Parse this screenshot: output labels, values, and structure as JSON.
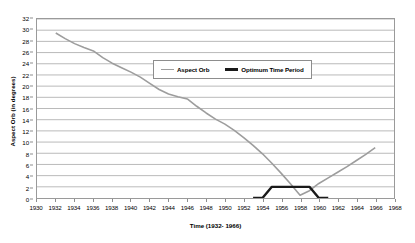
{
  "chart_data": {
    "type": "line",
    "title": "",
    "xlabel": "Time (1932- 1966)",
    "ylabel": "Aspect Orb (in degrees)",
    "xlim": [
      1930,
      1968
    ],
    "ylim": [
      0,
      32
    ],
    "xticks": [
      1930,
      1932,
      1934,
      1936,
      1938,
      1940,
      1942,
      1944,
      1946,
      1948,
      1950,
      1952,
      1954,
      1956,
      1958,
      1960,
      1962,
      1964,
      1966,
      1968
    ],
    "yticks": [
      0,
      2,
      4,
      6,
      8,
      10,
      12,
      14,
      16,
      18,
      20,
      22,
      24,
      26,
      28,
      30,
      32
    ],
    "grid": "horizontal",
    "legend_position": "upper-center",
    "series": [
      {
        "name": "Aspect Orb",
        "color": "#9d9d9d",
        "width": 1.6,
        "x": [
          1932,
          1933,
          1934,
          1935,
          1936,
          1937,
          1938,
          1939,
          1940,
          1941,
          1942,
          1943,
          1944,
          1945,
          1946,
          1947,
          1948,
          1949,
          1950,
          1951,
          1952,
          1953,
          1954,
          1955,
          1956,
          1957,
          1958,
          1959,
          1960,
          1961,
          1962,
          1963,
          1964,
          1965,
          1966
        ],
        "values": [
          29.5,
          28.5,
          27.6,
          26.9,
          26.3,
          25.1,
          24.1,
          23.3,
          22.5,
          21.6,
          20.5,
          19.4,
          18.6,
          18.1,
          17.7,
          16.4,
          15.2,
          14.1,
          13.2,
          12.1,
          10.8,
          9.4,
          7.9,
          6.2,
          4.4,
          2.5,
          0.5,
          1.3,
          2.6,
          3.6,
          4.6,
          5.6,
          6.7,
          7.8,
          9.0
        ]
      },
      {
        "name": "Optimum Time Period",
        "color": "#1a1a1a",
        "width": 2.4,
        "x": [
          1953,
          1954,
          1955,
          1956,
          1957,
          1958,
          1959,
          1960,
          1961
        ],
        "values": [
          0,
          0,
          2,
          2,
          2,
          2,
          2,
          0,
          0
        ]
      }
    ]
  },
  "legend": {
    "entries": [
      {
        "label": "Aspect Orb",
        "swatch": "gray-line-swatch"
      },
      {
        "label": "Optimum Time Period",
        "swatch": "black-line-swatch"
      }
    ]
  }
}
